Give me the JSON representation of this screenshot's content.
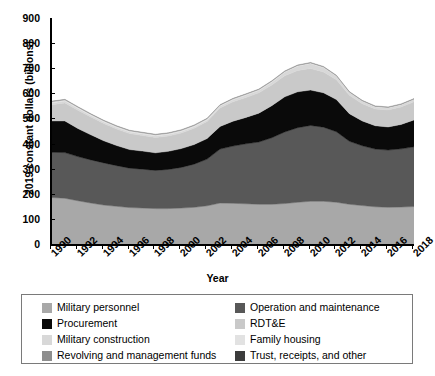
{
  "chart_data": {
    "type": "area",
    "stacked": true,
    "title": "",
    "xlabel": "Year",
    "ylabel": "2019 constant dollars (billions)",
    "xlim": [
      1990,
      2018
    ],
    "ylim": [
      0,
      900
    ],
    "ytick_labels": [
      "0",
      "100",
      "200",
      "300",
      "400",
      "500",
      "600",
      "700",
      "800",
      "900"
    ],
    "ytick_values": [
      0,
      100,
      200,
      300,
      400,
      500,
      600,
      700,
      800,
      900
    ],
    "xtick_labels": [
      "1990",
      "1992",
      "1994",
      "1996",
      "1998",
      "2000",
      "2002",
      "2004",
      "2006",
      "2008",
      "2010",
      "2012",
      "2014",
      "2016",
      "2018"
    ],
    "xtick_values": [
      1990,
      1992,
      1994,
      1996,
      1998,
      2000,
      2002,
      2004,
      2006,
      2008,
      2010,
      2012,
      2014,
      2016,
      2018
    ],
    "grid": false,
    "legend_position": "below-plot",
    "x": [
      1990,
      1991,
      1992,
      1993,
      1994,
      1995,
      1996,
      1997,
      1998,
      1999,
      2000,
      2001,
      2002,
      2003,
      2004,
      2005,
      2006,
      2007,
      2008,
      2009,
      2010,
      2011,
      2012,
      2013,
      2014,
      2015,
      2016,
      2017,
      2018
    ],
    "series": [
      {
        "name": "Military personnel",
        "color": "#a8a8a8",
        "values": [
          185,
          182,
          172,
          163,
          155,
          150,
          145,
          143,
          141,
          141,
          143,
          146,
          152,
          163,
          162,
          160,
          158,
          158,
          161,
          166,
          170,
          170,
          166,
          158,
          153,
          148,
          146,
          147,
          149
        ]
      },
      {
        "name": "Operation and maintenance",
        "color": "#585858",
        "values": [
          180,
          182,
          176,
          172,
          168,
          162,
          157,
          155,
          152,
          156,
          162,
          172,
          186,
          215,
          228,
          239,
          248,
          265,
          285,
          297,
          302,
          295,
          281,
          251,
          238,
          230,
          228,
          232,
          238
        ]
      },
      {
        "name": "Procurement",
        "color": "#0a0a0a",
        "values": [
          125,
          126,
          112,
          100,
          88,
          80,
          74,
          72,
          70,
          72,
          75,
          78,
          82,
          90,
          99,
          105,
          115,
          128,
          140,
          143,
          141,
          137,
          128,
          110,
          99,
          93,
          92,
          97,
          107
        ]
      },
      {
        "name": "RDT&E",
        "color": "#c9c9c9",
        "values": [
          65,
          72,
          73,
          71,
          69,
          66,
          64,
          62,
          61,
          61,
          62,
          65,
          68,
          74,
          77,
          79,
          81,
          82,
          84,
          85,
          86,
          83,
          79,
          73,
          69,
          67,
          68,
          70,
          72
        ]
      },
      {
        "name": "Military construction",
        "color": "#d8d8d8",
        "values": [
          7,
          7,
          7,
          6,
          6,
          6,
          6,
          6,
          6,
          6,
          6,
          6,
          6,
          7,
          8,
          9,
          9,
          11,
          14,
          17,
          19,
          17,
          14,
          11,
          9,
          8,
          8,
          8,
          9
        ]
      },
      {
        "name": "Family housing",
        "color": "#e2e2e2",
        "values": [
          5,
          5,
          5,
          5,
          5,
          5,
          5,
          5,
          5,
          5,
          5,
          5,
          5,
          4,
          4,
          4,
          4,
          4,
          3,
          3,
          3,
          3,
          2,
          2,
          2,
          2,
          2,
          2,
          2
        ]
      },
      {
        "name": "Revolving and management funds",
        "color": "#8e8e8e",
        "values": [
          2,
          2,
          2,
          2,
          2,
          2,
          2,
          2,
          2,
          2,
          2,
          2,
          2,
          2,
          2,
          2,
          2,
          2,
          2,
          2,
          2,
          2,
          2,
          2,
          2,
          2,
          2,
          2,
          2
        ]
      },
      {
        "name": "Trust, receipts, and other",
        "color": "#3c3c3c",
        "values": [
          -2,
          -2,
          -2,
          -2,
          -2,
          -2,
          -2,
          -2,
          -2,
          -2,
          -2,
          -2,
          -2,
          -2,
          -2,
          -2,
          -2,
          -2,
          -2,
          -2,
          -2,
          -2,
          -2,
          -2,
          -2,
          -2,
          -2,
          -2,
          -2
        ]
      }
    ],
    "totals": [
      567,
      574,
      545,
      517,
      491,
      469,
      451,
      443,
      435,
      441,
      453,
      472,
      499,
      553,
      578,
      598,
      615,
      648,
      687,
      713,
      721,
      705,
      670,
      605,
      570,
      550,
      546,
      558,
      579
    ]
  },
  "legend": {
    "items": [
      {
        "label": "Military personnel",
        "color": "#a8a8a8"
      },
      {
        "label": "Operation and maintenance",
        "color": "#585858"
      },
      {
        "label": "Procurement",
        "color": "#0a0a0a"
      },
      {
        "label": "RDT&E",
        "color": "#c9c9c9"
      },
      {
        "label": "Military construction",
        "color": "#d8d8d8"
      },
      {
        "label": "Family housing",
        "color": "#e2e2e2"
      },
      {
        "label": "Revolving and management funds",
        "color": "#8e8e8e"
      },
      {
        "label": "Trust, receipts, and other",
        "color": "#3c3c3c"
      }
    ],
    "left_column": [
      {
        "label": "Military personnel",
        "color": "#a8a8a8"
      },
      {
        "label": "Procurement",
        "color": "#0a0a0a"
      },
      {
        "label": "Military construction",
        "color": "#d8d8d8"
      },
      {
        "label": "Revolving and management funds",
        "color": "#8e8e8e"
      }
    ],
    "right_column": [
      {
        "label": "Operation and maintenance",
        "color": "#585858"
      },
      {
        "label": "RDT&E",
        "color": "#c9c9c9"
      },
      {
        "label": "Family housing",
        "color": "#e2e2e2"
      },
      {
        "label": "Trust, receipts, and other",
        "color": "#3c3c3c"
      }
    ]
  }
}
